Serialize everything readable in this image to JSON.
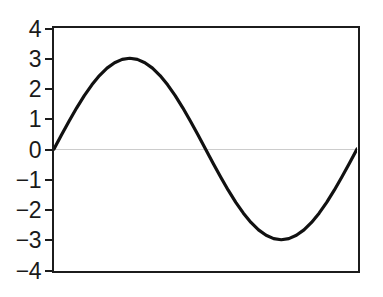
{
  "figure": {
    "background": "#ffffff",
    "axis_color": "#1c1c1c",
    "curve_color": "#111111",
    "zero_line_color": "#cccccc",
    "tick_label_color": "#1a1a1a"
  },
  "chart_data": {
    "type": "line",
    "title": "",
    "xlabel": "",
    "ylabel": "",
    "xlim": [
      0,
      1
    ],
    "ylim": [
      -4,
      4
    ],
    "ytick_values": [
      4,
      3,
      2,
      1,
      0,
      -1,
      -2,
      -3,
      -4
    ],
    "ytick_labels": [
      "4",
      "3",
      "2",
      "1",
      "0",
      "−1",
      "−2",
      "−3",
      "−4"
    ],
    "xtick_values": [],
    "xtick_labels": [],
    "grid": "single faint horizontal gridline at y=0",
    "legend": "none",
    "series": [
      {
        "name": "sine-wave",
        "x": [
          0,
          0.025,
          0.05,
          0.075,
          0.1,
          0.125,
          0.15,
          0.175,
          0.2,
          0.225,
          0.25,
          0.275,
          0.3,
          0.325,
          0.35,
          0.375,
          0.4,
          0.425,
          0.45,
          0.475,
          0.5,
          0.525,
          0.55,
          0.575,
          0.6,
          0.625,
          0.65,
          0.675,
          0.7,
          0.725,
          0.75,
          0.775,
          0.8,
          0.825,
          0.85,
          0.875,
          0.9,
          0.925,
          0.95,
          0.975,
          1
        ],
        "y": [
          0,
          0.469,
          0.927,
          1.362,
          1.763,
          2.121,
          2.427,
          2.673,
          2.853,
          2.963,
          3,
          2.963,
          2.853,
          2.673,
          2.427,
          2.121,
          1.763,
          1.362,
          0.927,
          0.469,
          0,
          -0.469,
          -0.927,
          -1.362,
          -1.763,
          -2.121,
          -2.427,
          -2.673,
          -2.853,
          -2.963,
          -3,
          -2.963,
          -2.853,
          -2.673,
          -2.427,
          -2.121,
          -1.763,
          -1.362,
          -0.927,
          -0.469,
          0
        ]
      }
    ]
  }
}
